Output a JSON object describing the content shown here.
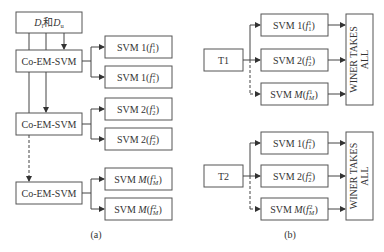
{
  "panel_a": {
    "caption": "(a)",
    "input_box": {
      "part1": "D",
      "sub1": "l",
      "mid": "和",
      "part2": "D",
      "sub2": "u"
    },
    "co_em_label": "Co-EM-SVM",
    "groups": [
      {
        "svms": [
          {
            "prefix": "SVM 1(",
            "f": "f",
            "sub": "1",
            "sup": "1",
            "suffix": ")"
          },
          {
            "prefix": "SVM 1(",
            "f": "f",
            "sub": "1",
            "sup": "2",
            "suffix": ")"
          }
        ]
      },
      {
        "svms": [
          {
            "prefix": "SVM 2(",
            "f": "f",
            "sub": "2",
            "sup": "1",
            "suffix": ")"
          },
          {
            "prefix": "SVM 2(",
            "f": "f",
            "sub": "2",
            "sup": "2",
            "suffix": ")"
          }
        ]
      },
      {
        "svms": [
          {
            "prefix": "SVM ",
            "m": "M",
            "paren": "(",
            "f": "f",
            "sub": "M",
            "sup": "1",
            "suffix": ")"
          },
          {
            "prefix": "SVM ",
            "m": "M",
            "paren": "(",
            "f": "f",
            "sub": "M",
            "sup": "2",
            "suffix": ")"
          }
        ]
      }
    ]
  },
  "panel_b": {
    "caption": "(b)",
    "wta_label_line1": "WINER TAKES",
    "wta_label_line2": "ALL",
    "blocks": [
      {
        "input": "T1",
        "svms": [
          {
            "prefix": "SVM 1(",
            "f": "f",
            "sub": "1",
            "sup": "1",
            "suffix": ")"
          },
          {
            "prefix": "SVM 2(",
            "f": "f",
            "sub": "2",
            "sup": "1",
            "suffix": ")"
          },
          {
            "prefix": "SVM ",
            "m": "M",
            "paren": "(",
            "f": "f",
            "sub": "M",
            "sup": "1",
            "suffix": ")"
          }
        ]
      },
      {
        "input": "T2",
        "svms": [
          {
            "prefix": "SVM 1(",
            "f": "f",
            "sub": "1",
            "sup": "2",
            "suffix": ")"
          },
          {
            "prefix": "SVM 2(",
            "f": "f",
            "sub": "2",
            "sup": "2",
            "suffix": ")"
          },
          {
            "prefix": "SVM ",
            "m": "M",
            "paren": "(",
            "f": "f",
            "sub": "M",
            "sup": "2",
            "suffix": ")"
          }
        ]
      }
    ]
  }
}
